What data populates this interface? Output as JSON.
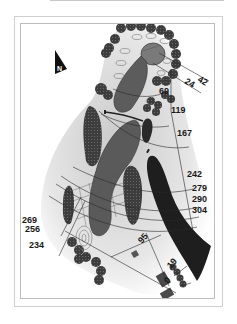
{
  "map": {
    "type": "golf hole yardage map",
    "compass": {
      "label": "N",
      "icon": "north-arrow-icon"
    },
    "colors": {
      "fairway": "#5a5a5a",
      "green": "#6e6e6e",
      "water": "#1e1e1e",
      "tree": "#3a3a3a",
      "rough_shadow": "#d6d6d6",
      "line": "#2a2a2a"
    },
    "yardage_markers": [
      {
        "id": "y24",
        "label": "24"
      },
      {
        "id": "y42",
        "label": "42"
      },
      {
        "id": "y69",
        "label": "69"
      },
      {
        "id": "y119",
        "label": "119"
      },
      {
        "id": "y167",
        "label": "167"
      },
      {
        "id": "y242",
        "label": "242"
      },
      {
        "id": "y279",
        "label": "279"
      },
      {
        "id": "y290",
        "label": "290"
      },
      {
        "id": "y304",
        "label": "304"
      },
      {
        "id": "y269",
        "label": "269"
      },
      {
        "id": "y256",
        "label": "256"
      },
      {
        "id": "y234",
        "label": "234"
      },
      {
        "id": "y95",
        "label": "95"
      },
      {
        "id": "y19",
        "label": "19"
      },
      {
        "id": "y0",
        "label": "0"
      }
    ]
  }
}
